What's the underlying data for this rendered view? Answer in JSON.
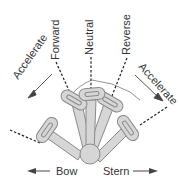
{
  "diagram": {
    "labels": {
      "accelerate_left": "Accelerate",
      "forward": "Forward",
      "neutral": "Neutral",
      "reverse": "Reverse",
      "accelerate_right": "Accelerate",
      "bow": "Bow",
      "stern": "Stern"
    },
    "colors": {
      "handle_fill": "#d6d6d6",
      "handle_stroke": "#8a8a8a",
      "line": "#222222",
      "text": "#333333"
    }
  }
}
